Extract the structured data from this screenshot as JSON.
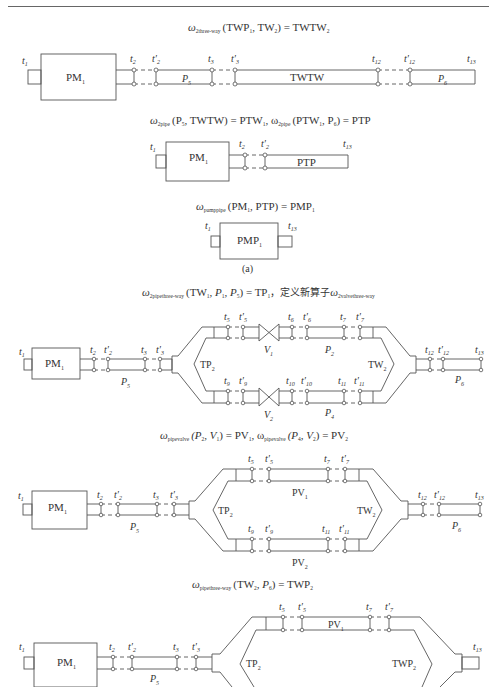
{
  "header": {
    "text": "· · · · · · · · · · · · · · · · · · · · · · · ·"
  },
  "formulas": {
    "f1": {
      "op": "ω",
      "op_sub": "2three-way",
      "args": "(TWP",
      "a1_sub": "1",
      "mid": ", TW",
      "a2_sub": "2",
      "rhs": ") = TWTW",
      "rhs_sub": "2"
    },
    "f2": {
      "text_a": "ω",
      "sub_a": "2pipe",
      "args_a": "(P",
      "p_sub": "5",
      "rest_a": ", TWTW) = PTW",
      "rsub_a": "1",
      "text_b": ", ω",
      "sub_b": "2pipe",
      "args_b": "(PTW",
      "bsub": "1",
      "rest_b": ", P",
      "p6": "6",
      "end_b": ") = PTP"
    },
    "f3": {
      "op": "ω",
      "op_sub": "pumppipe",
      "args": "(PM",
      "a1_sub": "1",
      "rest": ", PTP) = PMP",
      "rhs_sub": "1"
    },
    "f4": {
      "op": "ω",
      "op_sub": "2pipethree-way",
      "args": "(TW",
      "a1_sub": "1",
      "p1": ", P",
      "p1_sub": "1",
      "p5": ", P",
      "p5_sub": "5",
      "rhs": ") = TP",
      "rhs_sub": "1",
      "cn": "，定义新算子",
      "op2": "ω",
      "op2_sub": "2valvethree-way"
    },
    "f5": {
      "op": "ω",
      "op_sub": "pipevalve",
      "args": "(P",
      "a_sub": "2",
      "v": ", V",
      "v_sub": "1",
      "rhs": ") = PV",
      "rhs_sub": "1",
      "op_b": ", ω",
      "op_b_sub": "pipevalve",
      "args_b": "(P",
      "b_sub": "4",
      "v2": ", V",
      "v2_sub": "2",
      "rhs_b": ") = PV",
      "rhs_b_sub": "2"
    },
    "f6": {
      "op": "ω",
      "op_sub": "pipethree-way",
      "args": "(TW",
      "a_sub": "2",
      "p": ", P",
      "p_sub": "6",
      "rhs": ") = TWP",
      "rhs_sub": "2"
    }
  },
  "diagrams": {
    "d1": {
      "box": "PM",
      "box_sub": "1",
      "pipe5": "P",
      "pipe5_sub": "5",
      "twtw": "TWTW",
      "pipe6": "P",
      "pipe6_sub": "6",
      "labels": [
        "t1",
        "t2",
        "t'2",
        "t3",
        "t'3",
        "t12",
        "t'12",
        "t13"
      ]
    },
    "d2": {
      "box": "PM",
      "box_sub": "1",
      "ptp": "PTP",
      "labels": [
        "t1",
        "t2",
        "t'2",
        "t13"
      ]
    },
    "d3": {
      "box": "PMP",
      "box_sub": "1",
      "labels": [
        "t1",
        "t13"
      ],
      "caption": "(a)"
    },
    "d4": {
      "box": "PM",
      "box_sub": "1",
      "tp": "TP",
      "tp_sub": "2",
      "tw": "TW",
      "tw_sub": "2",
      "v1": "V",
      "v1_sub": "1",
      "v2": "V",
      "v2_sub": "2",
      "p2": "P",
      "p2_sub": "2",
      "p4": "P",
      "p4_sub": "4",
      "p5": "P",
      "p5_sub": "5",
      "p6": "P",
      "p6_sub": "6"
    },
    "d5": {
      "box": "PM",
      "box_sub": "1",
      "tp": "TP",
      "tp_sub": "2",
      "tw": "TW",
      "tw_sub": "2",
      "pv1": "PV",
      "pv1_sub": "1",
      "pv2": "PV",
      "pv2_sub": "2",
      "p5": "P",
      "p5_sub": "5",
      "p6": "P",
      "p6_sub": "6"
    },
    "d6": {
      "box": "PM",
      "box_sub": "1",
      "tp": "TP",
      "tp_sub": "2",
      "twp": "TWP",
      "twp_sub": "2",
      "pv1": "PV",
      "pv1_sub": "1",
      "p5": "P",
      "p5_sub": "5"
    }
  }
}
